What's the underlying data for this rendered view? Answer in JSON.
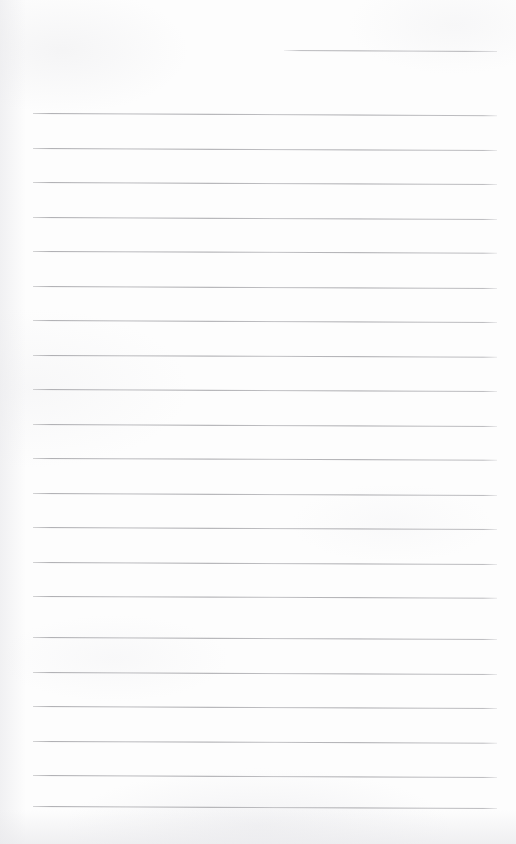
{
  "page": {
    "kind": "scanned-blank-lined-notebook-page",
    "width": 516,
    "height": 844,
    "paper_color": "#fdfdfd",
    "rule_color": "#b0b0b4",
    "text_content": "",
    "handwriting_present": "none",
    "printed_text_present": "none"
  },
  "ruling": {
    "line_count": 22,
    "spacing_px": 34.5,
    "left_margin_x": 33,
    "right_margin_x": 497,
    "slant_deg": 0.25,
    "lines": [
      {
        "id": "line-01",
        "y": 50,
        "x": 284,
        "width": 213,
        "slant": 0.3
      },
      {
        "id": "line-02",
        "y": 113,
        "x": 33,
        "width": 464,
        "slant": 0.28
      },
      {
        "id": "line-03",
        "y": 148,
        "x": 33,
        "width": 464,
        "slant": 0.26
      },
      {
        "id": "line-04",
        "y": 182,
        "x": 33,
        "width": 464,
        "slant": 0.24
      },
      {
        "id": "line-05",
        "y": 217,
        "x": 33,
        "width": 464,
        "slant": 0.26
      },
      {
        "id": "line-06",
        "y": 251,
        "x": 33,
        "width": 464,
        "slant": 0.22
      },
      {
        "id": "line-07",
        "y": 286,
        "x": 33,
        "width": 464,
        "slant": 0.24
      },
      {
        "id": "line-08",
        "y": 320,
        "x": 33,
        "width": 464,
        "slant": 0.26
      },
      {
        "id": "line-09",
        "y": 355,
        "x": 33,
        "width": 464,
        "slant": 0.22
      },
      {
        "id": "line-10",
        "y": 389,
        "x": 33,
        "width": 464,
        "slant": 0.24
      },
      {
        "id": "line-11",
        "y": 424,
        "x": 33,
        "width": 464,
        "slant": 0.26
      },
      {
        "id": "line-12",
        "y": 458,
        "x": 33,
        "width": 464,
        "slant": 0.22
      },
      {
        "id": "line-13",
        "y": 493,
        "x": 33,
        "width": 464,
        "slant": 0.24
      },
      {
        "id": "line-14",
        "y": 527,
        "x": 33,
        "width": 464,
        "slant": 0.26
      },
      {
        "id": "line-15",
        "y": 562,
        "x": 33,
        "width": 464,
        "slant": 0.24
      },
      {
        "id": "line-16",
        "y": 596,
        "x": 33,
        "width": 464,
        "slant": 0.22
      },
      {
        "id": "line-17",
        "y": 637,
        "x": 33,
        "width": 464,
        "slant": 0.26
      },
      {
        "id": "line-18",
        "y": 672,
        "x": 33,
        "width": 464,
        "slant": 0.24
      },
      {
        "id": "line-19",
        "y": 706,
        "x": 33,
        "width": 464,
        "slant": 0.26
      },
      {
        "id": "line-20",
        "y": 741,
        "x": 33,
        "width": 464,
        "slant": 0.22
      },
      {
        "id": "line-21",
        "y": 775,
        "x": 33,
        "width": 464,
        "slant": 0.24
      },
      {
        "id": "line-22",
        "y": 806,
        "x": 33,
        "width": 464,
        "slant": 0.26
      }
    ]
  }
}
